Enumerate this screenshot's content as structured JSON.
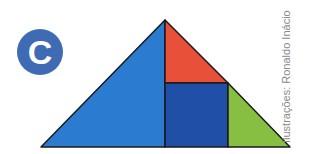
{
  "label": {
    "text": "C",
    "color": "#3f6ab4"
  },
  "credit": {
    "text": "Ilustrações: Ronaldo Inácio"
  },
  "figure": {
    "pieces": [
      {
        "name": "large-blue-triangle",
        "color": "#2b7bd1",
        "points": "165,20 165,147 41,147"
      },
      {
        "name": "red-triangle",
        "color": "#e8503a",
        "points": "165,20 228,83 165,83"
      },
      {
        "name": "dark-blue-square",
        "color": "#1f4fa6",
        "points": "165,83 228,83 228,147 165,147"
      },
      {
        "name": "green-triangle",
        "color": "#86bf42",
        "points": "228,83 290,147 228,147"
      }
    ],
    "stroke": "#1a1a1a"
  }
}
